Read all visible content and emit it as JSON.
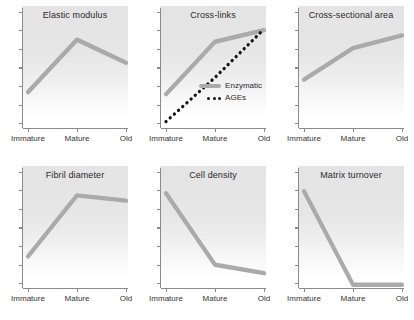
{
  "figure": {
    "title": "",
    "background_color": "#ffffff",
    "panel_background_color": "#e4e4e4",
    "series_colors": {
      "enzymatic": "#aaaaaa",
      "ages": "#141414"
    }
  },
  "legend": {
    "position": "inside-panel-2-bottom-right",
    "entries": [
      {
        "label": "Enzymatic",
        "style": "solid",
        "color": "#aaaaaa"
      },
      {
        "label": "AGEs",
        "style": "dotted",
        "color": "#141414"
      }
    ]
  },
  "categories": [
    "Immature",
    "Mature",
    "Old"
  ],
  "chart_data": [
    {
      "type": "line",
      "title": "Elastic modulus",
      "xlabel": "",
      "ylabel": "",
      "categories": [
        "Immature",
        "Mature",
        "Old"
      ],
      "ylim": [
        0,
        100
      ],
      "grid": false,
      "series": [
        {
          "name": "Enzymatic",
          "values": [
            34,
            84,
            62
          ]
        }
      ]
    },
    {
      "type": "line",
      "title": "Cross-links",
      "xlabel": "",
      "ylabel": "",
      "categories": [
        "Immature",
        "Mature",
        "Old"
      ],
      "ylim": [
        0,
        100
      ],
      "grid": false,
      "series": [
        {
          "name": "Enzymatic",
          "values": [
            32,
            82,
            93
          ]
        },
        {
          "name": "AGEs",
          "values": [
            6,
            48,
            94
          ]
        }
      ]
    },
    {
      "type": "line",
      "title": "Cross-sectional area",
      "xlabel": "",
      "ylabel": "",
      "categories": [
        "Immature",
        "Mature",
        "Old"
      ],
      "ylim": [
        0,
        100
      ],
      "grid": false,
      "series": [
        {
          "name": "Enzymatic",
          "values": [
            46,
            76,
            88
          ]
        }
      ]
    },
    {
      "type": "line",
      "title": "Fibril diameter",
      "xlabel": "",
      "ylabel": "",
      "categories": [
        "Immature",
        "Mature",
        "Old"
      ],
      "ylim": [
        0,
        100
      ],
      "grid": false,
      "series": [
        {
          "name": "Enzymatic",
          "values": [
            30,
            88,
            83
          ]
        }
      ]
    },
    {
      "type": "line",
      "title": "Cell density",
      "xlabel": "",
      "ylabel": "",
      "categories": [
        "Immature",
        "Mature",
        "Old"
      ],
      "ylim": [
        0,
        100
      ],
      "grid": false,
      "series": [
        {
          "name": "Enzymatic",
          "values": [
            90,
            22,
            14
          ]
        }
      ]
    },
    {
      "type": "line",
      "title": "Matrix turnover",
      "xlabel": "",
      "ylabel": "",
      "categories": [
        "Immature",
        "Mature",
        "Old"
      ],
      "ylim": [
        0,
        100
      ],
      "grid": false,
      "series": [
        {
          "name": "Enzymatic",
          "values": [
            92,
            3,
            3
          ]
        }
      ]
    }
  ]
}
